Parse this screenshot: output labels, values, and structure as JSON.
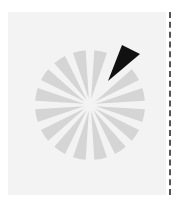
{
  "spinner": {
    "label": "Loading",
    "segments": 16,
    "center": [
      90,
      105
    ],
    "radius": 55,
    "active_index": 1,
    "colors": {
      "segment": "#d5d5d5",
      "active": "#111111",
      "gap": "#f3f3f3",
      "panel": "#f3f3f3"
    }
  }
}
